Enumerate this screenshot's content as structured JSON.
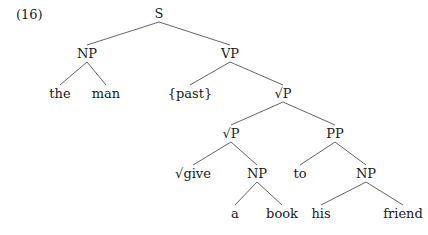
{
  "example": {
    "number": "(16)"
  },
  "tree": {
    "nodes": [
      {
        "id": "S",
        "label": "S",
        "x": 159,
        "y": 18
      },
      {
        "id": "NP1",
        "label": "NP",
        "x": 87,
        "y": 58
      },
      {
        "id": "VP",
        "label": "VP",
        "x": 230,
        "y": 58
      },
      {
        "id": "the",
        "label": "the",
        "x": 60,
        "y": 98
      },
      {
        "id": "man",
        "label": "man",
        "x": 106,
        "y": 98
      },
      {
        "id": "past",
        "label": "{past}",
        "x": 190,
        "y": 98
      },
      {
        "id": "RP1",
        "label": "√P",
        "x": 283,
        "y": 98
      },
      {
        "id": "RP2",
        "label": "√P",
        "x": 231,
        "y": 138
      },
      {
        "id": "PP",
        "label": "PP",
        "x": 335,
        "y": 138
      },
      {
        "id": "give",
        "label": "√give",
        "x": 193,
        "y": 178
      },
      {
        "id": "NP2",
        "label": "NP",
        "x": 257,
        "y": 178
      },
      {
        "id": "to",
        "label": "to",
        "x": 300,
        "y": 178
      },
      {
        "id": "NP3",
        "label": "NP",
        "x": 366,
        "y": 178
      },
      {
        "id": "a",
        "label": "a",
        "x": 235,
        "y": 218
      },
      {
        "id": "book",
        "label": "book",
        "x": 282,
        "y": 218
      },
      {
        "id": "his",
        "label": "his",
        "x": 321,
        "y": 218
      },
      {
        "id": "friend",
        "label": "friend",
        "x": 403,
        "y": 218
      }
    ],
    "edges": [
      [
        "S",
        "NP1"
      ],
      [
        "S",
        "VP"
      ],
      [
        "NP1",
        "the"
      ],
      [
        "NP1",
        "man"
      ],
      [
        "VP",
        "past"
      ],
      [
        "VP",
        "RP1"
      ],
      [
        "RP1",
        "RP2"
      ],
      [
        "RP1",
        "PP"
      ],
      [
        "RP2",
        "give"
      ],
      [
        "RP2",
        "NP2"
      ],
      [
        "PP",
        "to"
      ],
      [
        "PP",
        "NP3"
      ],
      [
        "NP2",
        "a"
      ],
      [
        "NP2",
        "book"
      ],
      [
        "NP3",
        "his"
      ],
      [
        "NP3",
        "friend"
      ]
    ]
  }
}
